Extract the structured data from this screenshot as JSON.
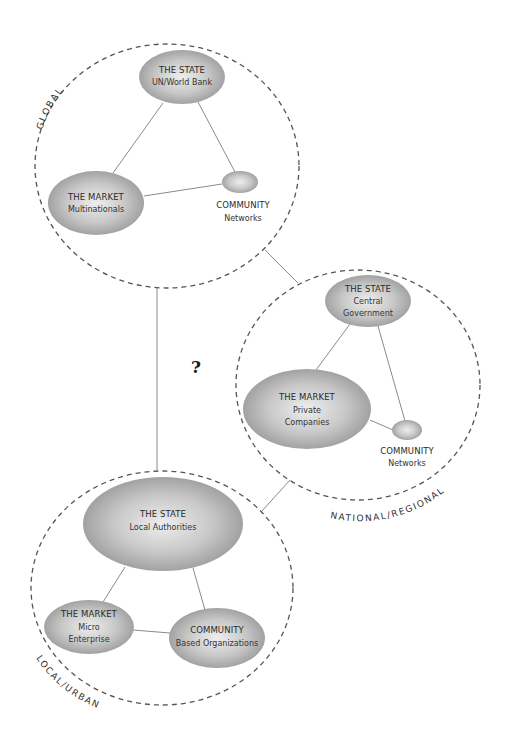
{
  "diagram": {
    "question_mark": "?",
    "colors": {
      "node_fill_center": "#e6e6e6",
      "node_fill_edge": "#9a9a9a",
      "dashed_border": "#555555",
      "link": "#8a8a8a",
      "text": "#2a2a2a"
    },
    "scopes": {
      "global": {
        "label": "GLOBAL",
        "state": {
          "title": "THE STATE",
          "sub1": "UN/World Bank"
        },
        "market": {
          "title": "THE MARKET",
          "sub1": "Multinationals"
        },
        "community": {
          "title": "COMMUNITY",
          "sub1": "Networks"
        }
      },
      "national": {
        "label": "NATIONAL/REGIONAL",
        "state": {
          "title": "THE STATE",
          "sub1": "Central",
          "sub2": "Government"
        },
        "market": {
          "title": "THE MARKET",
          "sub1": "Private",
          "sub2": "Companies"
        },
        "community": {
          "title": "COMMUNITY",
          "sub1": "Networks"
        }
      },
      "local": {
        "label": "LOCAL/URBAN",
        "state": {
          "title": "THE STATE",
          "sub1": "Local Authorities"
        },
        "market": {
          "title": "THE MARKET",
          "sub1": "Micro",
          "sub2": "Enterprise"
        },
        "community": {
          "title": "COMMUNITY",
          "sub1": "Based Organizations"
        }
      }
    }
  }
}
